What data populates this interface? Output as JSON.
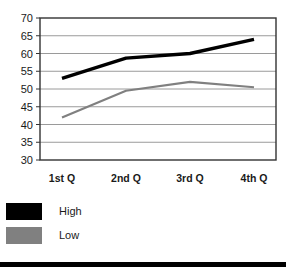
{
  "chart_data": {
    "type": "line",
    "title": "",
    "xlabel": "",
    "ylabel": "",
    "categories": [
      "1st Q",
      "2nd Q",
      "3rd Q",
      "4th Q"
    ],
    "series": [
      {
        "name": "High",
        "color": "#000000",
        "values": [
          53,
          58.7,
          60,
          64
        ]
      },
      {
        "name": "Low",
        "color": "#808080",
        "values": [
          42,
          49.5,
          52,
          50.5
        ]
      }
    ],
    "ylim": [
      30,
      70
    ],
    "ytick_step": 5,
    "yticks": [
      30,
      35,
      40,
      45,
      50,
      55,
      60,
      65,
      70
    ],
    "grid": "horizontal",
    "legend_position": "bottom-left",
    "plot_border_color": "#333333",
    "gridline_color": "#9a9a9a"
  },
  "axis": {
    "y_tick_labels": [
      "70",
      "65",
      "60",
      "55",
      "50",
      "45",
      "40",
      "35",
      "30"
    ],
    "x_tick_labels": [
      "1st Q",
      "2nd Q",
      "3rd Q",
      "4th Q"
    ]
  },
  "legend": {
    "items": [
      {
        "label": "High",
        "swatch": "black-swatch"
      },
      {
        "label": "Low",
        "swatch": "gray-swatch"
      }
    ]
  },
  "header": {
    "clipped_title": ""
  }
}
